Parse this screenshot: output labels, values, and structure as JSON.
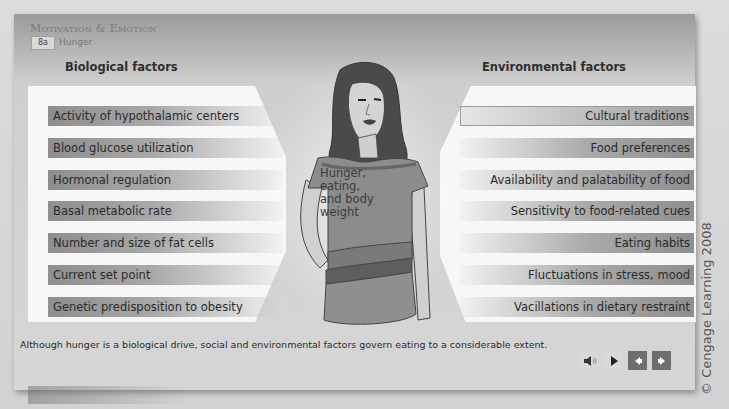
{
  "header": {
    "title": "Motivation & Emotion",
    "section_number": "8a",
    "section_name": "Hunger"
  },
  "biological": {
    "heading": "Biological factors",
    "items": [
      "Activity of hypothalamic centers",
      "Blood glucose utilization",
      "Hormonal regulation",
      "Basal metabolic rate",
      "Number and size of fat cells",
      "Current set point",
      "Genetic predisposition to obesity"
    ]
  },
  "environmental": {
    "heading": "Environmental factors",
    "selected_index": 0,
    "items": [
      "Cultural traditions",
      "Food preferences",
      "Availability and palatability of food",
      "Sensitivity to food-related cues",
      "Eating habits",
      "Fluctuations in stress, mood",
      "Vacillations in dietary restraint"
    ]
  },
  "center": {
    "shirt_lines": [
      "Hunger,",
      "eating,",
      "and body",
      "weight"
    ]
  },
  "caption": "Although hunger is a biological drive, social and environmental factors govern eating to a considerable extent.",
  "controls": {
    "audio_icon": "speaker-icon",
    "play_icon": "play-icon",
    "prev_icon": "arrow-left-icon",
    "next_icon": "arrow-right-icon"
  },
  "copyright": "© Cengage Learning 2008",
  "colors": {
    "panel_dark": "#9a9a9a",
    "panel_light": "#d6d6d6",
    "factor_bar": "#8e8e8e",
    "backdrop": "#f7f7f7",
    "nav_button": "#6f6f6f"
  }
}
